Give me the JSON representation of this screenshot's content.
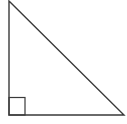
{
  "diagram": {
    "type": "right-triangle",
    "stroke_color": "#3a3a3a",
    "background": "#ffffff",
    "vertices": {
      "top": [
        9,
        1
      ],
      "right_angle": [
        9,
        115
      ],
      "bottom_right": [
        124,
        115
      ]
    },
    "right_angle_marker": {
      "x": 9,
      "y": 97,
      "size": 16
    }
  }
}
